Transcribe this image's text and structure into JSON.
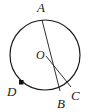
{
  "figure": {
    "type": "circle-geometry-diagram",
    "background_color": "#ffffff",
    "stroke_color": "#1a1a1a",
    "marker_color": "#111111",
    "circle": {
      "center_label": "O",
      "center_x": 45,
      "center_y": 55,
      "radius": 35
    },
    "labels": {
      "a": "A",
      "b": "B",
      "c": "C",
      "d": "D",
      "o": "O"
    },
    "points": [
      {
        "name": "A",
        "label": "A",
        "x": 42,
        "y": 20,
        "on_circle": true
      },
      {
        "name": "B",
        "label": "B",
        "x": 60,
        "y": 91,
        "on_circle": true
      },
      {
        "name": "C",
        "label": "C",
        "x": 71,
        "y": 86,
        "on_circle": true
      },
      {
        "name": "D",
        "label": "D",
        "x": 21,
        "y": 82,
        "on_circle": true,
        "marker": "filled-square"
      },
      {
        "name": "O",
        "label": "O",
        "x": 45,
        "y": 55,
        "on_circle": false
      }
    ],
    "segments": [
      {
        "name": "AB",
        "from": "A",
        "to": "B"
      },
      {
        "name": "OC",
        "from": "O",
        "to": "C"
      }
    ]
  }
}
